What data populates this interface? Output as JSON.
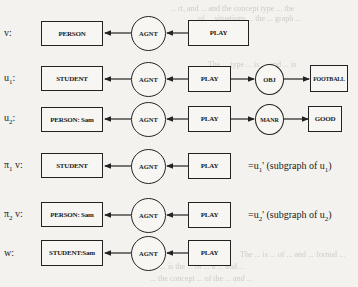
{
  "diagram": {
    "type": "conceptual-graphs",
    "rows": [
      {
        "label": {
          "sym": "v",
          "sub": "",
          "suffix": ":"
        },
        "concept": "PERSON",
        "relation": "AGNT",
        "act": "PLAY",
        "extra_relation": null,
        "extra_concept": null,
        "note": null
      },
      {
        "label": {
          "sym": "u",
          "sub": "1",
          "suffix": ":"
        },
        "concept": "STUDENT",
        "relation": "AGNT",
        "act": "PLAY",
        "extra_relation": "OBJ",
        "extra_concept": "FOOTBALL",
        "note": null
      },
      {
        "label": {
          "sym": "u",
          "sub": "2",
          "suffix": ":"
        },
        "concept": "PERSON: Sam",
        "relation": "AGNT",
        "act": "PLAY",
        "extra_relation": "MANR",
        "extra_concept": "GOOD",
        "note": null
      },
      {
        "label": {
          "sym": "π",
          "sub": "1",
          "suffix": " v:"
        },
        "concept": "STUDENT",
        "relation": "AGNT",
        "act": "PLAY",
        "extra_relation": null,
        "extra_concept": null,
        "note": {
          "pre": "=u",
          "sub1": "1",
          "mid": "' (subgraph of u",
          "sub2": "1",
          "post": ")"
        }
      },
      {
        "label": {
          "sym": "π",
          "sub": "2",
          "suffix": " v:"
        },
        "concept": "PERSON: Sam",
        "relation": "AGNT",
        "act": "PLAY",
        "extra_relation": null,
        "extra_concept": null,
        "note": {
          "pre": "=u",
          "sub1": "2",
          "mid": "' (subgraph of u",
          "sub2": "2",
          "post": ")"
        }
      },
      {
        "label": {
          "sym": "w",
          "sub": "",
          "suffix": ":"
        },
        "concept": "STUDENT:Sam",
        "relation": "AGNT",
        "act": "PLAY",
        "extra_relation": null,
        "extra_concept": null,
        "note": null
      }
    ]
  },
  "background_text": [
    "... rt, and ... and the concept type ... the",
    "... of ... situations ... the ... graph ...",
    "... The ... type ... is ... and ... is",
    "The ... is ... of ... and ... formal ...",
    "... is the ... of ... a ... and ...",
    "... the concept ... of the ... and ..."
  ]
}
